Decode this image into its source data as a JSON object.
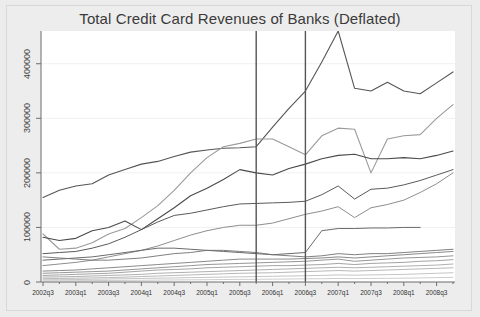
{
  "chart_data": {
    "type": "line",
    "title": "Total Credit Card Revenues of Banks (Deflated)",
    "xlabel": "",
    "ylabel": "",
    "ylim": [
      0,
      460000
    ],
    "yticks": [
      0,
      100000,
      200000,
      300000,
      400000
    ],
    "ytick_labels": [
      "0",
      "100000",
      "200000",
      "300000",
      "400000"
    ],
    "grid": true,
    "legend": "none",
    "x": [
      "2002q3",
      "2002q4",
      "2003q1",
      "2003q2",
      "2003q3",
      "2003q4",
      "2004q1",
      "2004q2",
      "2004q3",
      "2004q4",
      "2005q1",
      "2005q2",
      "2005q3",
      "2005q4",
      "2006q1",
      "2006q2",
      "2006q3",
      "2006q4",
      "2007q1",
      "2007q2",
      "2007q3",
      "2007q4",
      "2008q1",
      "2008q2",
      "2008q3",
      "2008q4"
    ],
    "xtick_labels": [
      "2002q3",
      "2003q1",
      "2003q3",
      "2004q1",
      "2004q3",
      "2005q1",
      "2005q3",
      "2006q1",
      "2006q3",
      "2007q1",
      "2007q3",
      "2008q1",
      "2008q3"
    ],
    "annotations": [
      {
        "type": "vline",
        "x": "2005q4",
        "label": "reference-line-1",
        "color": "#555555"
      },
      {
        "type": "vline",
        "x": "2006q3",
        "label": "reference-line-2",
        "color": "#555555"
      }
    ],
    "series": [
      {
        "name": "bank-a",
        "color": "#555555",
        "width": 1.1,
        "values": [
          155000,
          168000,
          176000,
          180000,
          196000,
          206000,
          216000,
          221000,
          230000,
          238000,
          242000,
          245000,
          246000,
          248000,
          284000,
          318000,
          350000,
          403000,
          460000,
          355000,
          350000,
          366000,
          350000,
          345000,
          365000,
          385000
        ]
      },
      {
        "name": "bank-b",
        "color": "#9a9a9a",
        "width": 1.1,
        "values": [
          88000,
          60000,
          62000,
          72000,
          88000,
          98000,
          118000,
          140000,
          168000,
          200000,
          228000,
          248000,
          254000,
          262000,
          262000,
          248000,
          233000,
          268000,
          282000,
          280000,
          200000,
          262000,
          268000,
          270000,
          300000,
          325000
        ]
      },
      {
        "name": "bank-c",
        "color": "#4a4a4a",
        "width": 1.1,
        "values": [
          82000,
          76000,
          80000,
          94000,
          100000,
          112000,
          96000,
          116000,
          136000,
          158000,
          172000,
          188000,
          206000,
          200000,
          196000,
          208000,
          216000,
          226000,
          232000,
          234000,
          226000,
          226000,
          228000,
          226000,
          232000,
          240000
        ]
      },
      {
        "name": "bank-d",
        "color": "#5a5a5a",
        "width": 1.0,
        "values": [
          52000,
          54000,
          56000,
          62000,
          70000,
          82000,
          96000,
          110000,
          122000,
          126000,
          132000,
          138000,
          143000,
          144000,
          145000,
          146000,
          148000,
          160000,
          176000,
          152000,
          170000,
          172000,
          178000,
          186000,
          196000,
          206000
        ]
      },
      {
        "name": "bank-e",
        "color": "#8e8e8e",
        "width": 1.0,
        "values": [
          30000,
          33000,
          36000,
          40000,
          46000,
          52000,
          58000,
          66000,
          76000,
          86000,
          94000,
          100000,
          104000,
          104000,
          108000,
          116000,
          124000,
          130000,
          138000,
          118000,
          136000,
          142000,
          150000,
          164000,
          180000,
          200000
        ]
      },
      {
        "name": "bank-f",
        "color": "#6b6b6b",
        "width": 1.0,
        "values": [
          40000,
          42000,
          44000,
          46000,
          50000,
          54000,
          58000,
          62000,
          62000,
          60000,
          58000,
          56000,
          54000,
          52000,
          50000,
          52000,
          54000,
          94000,
          98000,
          98000,
          99000,
          99000,
          100000,
          100000,
          null,
          null
        ]
      },
      {
        "name": "bank-g",
        "color": "#707070",
        "width": 0.9,
        "values": [
          46000,
          44000,
          42000,
          40000,
          40000,
          42000,
          44000,
          48000,
          52000,
          54000,
          58000,
          58000,
          56000,
          54000,
          50000,
          48000,
          46000,
          48000,
          52000,
          50000,
          52000,
          52000,
          54000,
          56000,
          58000,
          60000
        ]
      },
      {
        "name": "bank-h",
        "color": "#7c7c7c",
        "width": 0.9,
        "values": [
          20000,
          21000,
          22000,
          24000,
          26000,
          28000,
          30000,
          32000,
          34000,
          36000,
          38000,
          40000,
          42000,
          42000,
          42000,
          42000,
          43000,
          44000,
          46000,
          44000,
          46000,
          48000,
          50000,
          52000,
          54000,
          56000
        ]
      },
      {
        "name": "bank-i",
        "color": "#8a8a8a",
        "width": 0.9,
        "values": [
          16000,
          17000,
          18000,
          19000,
          20000,
          22000,
          24000,
          26000,
          28000,
          30000,
          32000,
          33000,
          34000,
          35000,
          36000,
          37000,
          38000,
          40000,
          42000,
          38000,
          40000,
          42000,
          44000,
          45000,
          46000,
          48000
        ]
      },
      {
        "name": "bank-j",
        "color": "#989898",
        "width": 0.9,
        "values": [
          12000,
          13000,
          14000,
          15000,
          16000,
          18000,
          20000,
          22000,
          23000,
          24000,
          26000,
          27000,
          28000,
          29000,
          30000,
          30000,
          31000,
          32000,
          34000,
          32000,
          34000,
          35000,
          36000,
          38000,
          39000,
          41000
        ]
      },
      {
        "name": "bank-k",
        "color": "#a6a6a6",
        "width": 0.9,
        "values": [
          9000,
          9500,
          10000,
          11000,
          12000,
          13000,
          14000,
          16000,
          17000,
          18000,
          19000,
          20000,
          21000,
          22000,
          23000,
          24000,
          25000,
          26000,
          27000,
          26000,
          27000,
          28000,
          29000,
          30000,
          31000,
          33000
        ]
      },
      {
        "name": "bank-l",
        "color": "#b0b0b0",
        "width": 0.9,
        "values": [
          6000,
          6500,
          7000,
          7500,
          8000,
          9000,
          10000,
          11000,
          12000,
          13000,
          14000,
          15000,
          16000,
          16500,
          17000,
          18000,
          19000,
          20000,
          21000,
          20000,
          21000,
          22000,
          23000,
          24000,
          25000,
          26000
        ]
      },
      {
        "name": "bank-m",
        "color": "#bdbdbd",
        "width": 0.9,
        "values": [
          4000,
          4200,
          4500,
          5000,
          5500,
          6000,
          6500,
          7000,
          7500,
          8000,
          8500,
          9000,
          9500,
          10000,
          10500,
          11000,
          11500,
          12000,
          13000,
          12500,
          13000,
          13500,
          14000,
          15000,
          16000,
          17000
        ]
      },
      {
        "name": "bank-n",
        "color": "#c7c7c7",
        "width": 0.9,
        "values": [
          2000,
          2200,
          2400,
          2600,
          2800,
          3000,
          3200,
          3500,
          3800,
          4000,
          4200,
          4500,
          4800,
          5000,
          5200,
          5500,
          5800,
          6000,
          6500,
          6200,
          6500,
          6800,
          7000,
          7500,
          8000,
          8500
        ]
      }
    ]
  }
}
